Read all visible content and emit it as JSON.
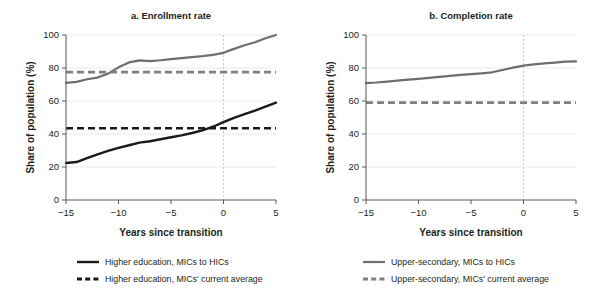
{
  "figure": {
    "width": 597,
    "height": 298,
    "background": "#ffffff"
  },
  "colors": {
    "dark": "#1a1a1a",
    "grey": "#6d6e70",
    "grey_dash": "#7f8081",
    "axis": "#58595b",
    "grid": "#e3e3e3",
    "vline": "#bcbcbc"
  },
  "legend": {
    "position": "bottom",
    "entries": [
      {
        "label": "Higher education, MICs to HICs",
        "style": "solid",
        "color": "#1a1a1a",
        "column": 1,
        "row": 1
      },
      {
        "label": "Higher education, MICs' current average",
        "style": "dashed",
        "color": "#1a1a1a",
        "column": 1,
        "row": 2
      },
      {
        "label": "Upper-secondary, MICs to HICs",
        "style": "solid",
        "color": "#6d6e70",
        "column": 2,
        "row": 1
      },
      {
        "label": "Upper-secondary, MICs' current average",
        "style": "dashed",
        "color": "#7f8081",
        "column": 2,
        "row": 2
      }
    ]
  },
  "chart_data": [
    {
      "type": "line",
      "panel": "a",
      "title": "a. Enrollment rate",
      "xlabel": "Years since transition",
      "ylabel": "Share of population (%)",
      "xlim": [
        -15,
        5
      ],
      "ylim": [
        0,
        100
      ],
      "xticks": [
        -15,
        -10,
        -5,
        0,
        5
      ],
      "xticklabels": [
        "−15",
        "−10",
        "−5",
        "0",
        "5"
      ],
      "yticks": [
        0,
        20,
        40,
        60,
        80,
        100
      ],
      "yticklabels": [
        "0",
        "20",
        "40",
        "60",
        "80",
        "100"
      ],
      "grid": "horizontal",
      "vertical_reference_line": 0,
      "series": [
        {
          "name": "Upper-secondary, MICs to HICs",
          "style": "solid",
          "color": "#6d6e70",
          "x": [
            -15,
            -14,
            -13,
            -12,
            -11,
            -10,
            -9,
            -8,
            -7,
            -6,
            -5,
            -4,
            -3,
            -2,
            -1,
            0,
            1,
            2,
            3,
            4,
            5
          ],
          "values": [
            71.0,
            71.6,
            73.2,
            74.2,
            76.6,
            80.4,
            83.4,
            84.6,
            84.2,
            84.7,
            85.4,
            86.0,
            86.6,
            87.2,
            88.0,
            89.2,
            91.6,
            93.8,
            95.6,
            98.0,
            100.0
          ]
        },
        {
          "name": "Upper-secondary, MICs' current average",
          "style": "dashed",
          "color": "#7f8081",
          "constant": 77.5
        },
        {
          "name": "Higher education, MICs to HICs",
          "style": "solid",
          "color": "#1a1a1a",
          "x": [
            -15,
            -14,
            -13,
            -12,
            -11,
            -10,
            -9,
            -8,
            -7,
            -6,
            -5,
            -4,
            -3,
            -2,
            -1,
            0,
            1,
            2,
            3,
            4,
            5
          ],
          "values": [
            22.4,
            23.0,
            25.4,
            27.6,
            29.8,
            31.6,
            33.2,
            34.8,
            35.6,
            36.8,
            38.0,
            39.2,
            40.6,
            42.2,
            44.4,
            47.2,
            49.8,
            52.0,
            54.2,
            56.6,
            59.0
          ]
        },
        {
          "name": "Higher education, MICs' current average",
          "style": "dashed",
          "color": "#1a1a1a",
          "constant": 43.5
        }
      ]
    },
    {
      "type": "line",
      "panel": "b",
      "title": "b. Completion rate",
      "xlabel": "Years since transition",
      "ylabel": "Share of population (%)",
      "xlim": [
        -15,
        5
      ],
      "ylim": [
        0,
        100
      ],
      "xticks": [
        -15,
        -10,
        -5,
        0,
        5
      ],
      "xticklabels": [
        "−15",
        "−10",
        "−5",
        "0",
        "5"
      ],
      "yticks": [
        0,
        20,
        40,
        60,
        80,
        100
      ],
      "yticklabels": [
        "0",
        "20",
        "40",
        "60",
        "80",
        "100"
      ],
      "grid": "horizontal",
      "vertical_reference_line": 0,
      "series": [
        {
          "name": "Upper-secondary, MICs to HICs",
          "style": "solid",
          "color": "#6d6e70",
          "x": [
            -15,
            -14,
            -13,
            -12,
            -11,
            -10,
            -9,
            -8,
            -7,
            -6,
            -5,
            -4,
            -3,
            -2,
            -1,
            0,
            1,
            2,
            3,
            4,
            5
          ],
          "values": [
            70.8,
            71.2,
            71.8,
            72.4,
            72.9,
            73.4,
            74.0,
            74.6,
            75.2,
            75.8,
            76.3,
            76.8,
            77.4,
            78.8,
            80.2,
            81.4,
            82.2,
            82.8,
            83.3,
            83.9,
            84.0
          ]
        },
        {
          "name": "Upper-secondary, MICs' current average",
          "style": "dashed",
          "color": "#7f8081",
          "constant": 59.0
        }
      ]
    }
  ]
}
